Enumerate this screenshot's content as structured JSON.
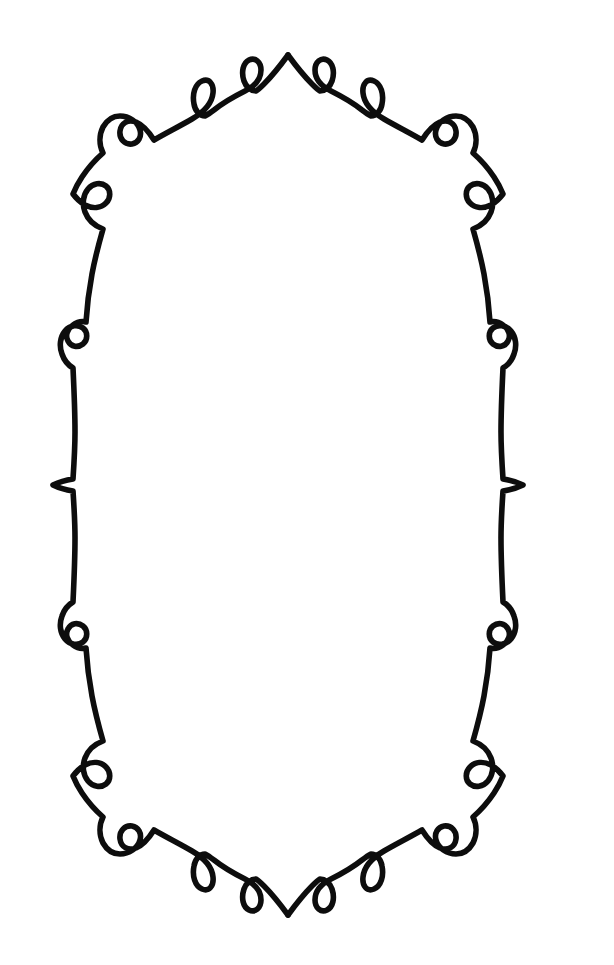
{
  "artwork": {
    "title": "Decorative Oval Scroll Frame",
    "kind": "line-ornament",
    "canvas_width": 614,
    "canvas_height": 965,
    "background_color": "#ffffff",
    "stroke_color": "#0d0d0d",
    "stroke_width": 5.6,
    "symmetry": "bilateral vertical mirror; near top-bottom mirror",
    "orientation": "portrait",
    "line_count": 1,
    "description": "A single continuous calligraphic line forming a tall oval border decorated with teardrop loops, round curls, and paired spiral hooks."
  },
  "geometry": {
    "oval_center_x": 295,
    "oval_center_y": 484,
    "oval_half_width": 280,
    "oval_half_height": 430,
    "top_cusp": {
      "x": 288,
      "y": 55
    },
    "bottom_cusp": {
      "x": 285,
      "y": 912
    },
    "left_cusp": {
      "x": 8,
      "y": 485
    },
    "right_cusp": {
      "x": 560,
      "y": 485
    }
  },
  "motifs": [
    {
      "name": "top-cusp",
      "type": "cusp",
      "x": 288,
      "y": 55,
      "direction": "up"
    },
    {
      "name": "top-left-teardrop",
      "type": "teardrop-loop",
      "x": 240,
      "y": 70,
      "size": 30
    },
    {
      "name": "top-right-teardrop",
      "type": "teardrop-loop",
      "x": 334,
      "y": 70,
      "size": 30
    },
    {
      "name": "upper-left-teardrop",
      "type": "teardrop-loop",
      "x": 193,
      "y": 128,
      "size": 34
    },
    {
      "name": "upper-right-teardrop",
      "type": "teardrop-loop",
      "x": 378,
      "y": 128,
      "size": 34
    },
    {
      "name": "upper-left-double-curl",
      "type": "spiral-pair",
      "x": 126,
      "y": 140,
      "size": 40
    },
    {
      "name": "upper-right-double-curl",
      "type": "spiral-pair",
      "x": 446,
      "y": 140,
      "size": 40
    },
    {
      "name": "left-upper-round-loop",
      "type": "round-loop",
      "x": 85,
      "y": 230,
      "size": 26
    },
    {
      "name": "right-upper-round-loop",
      "type": "round-loop",
      "x": 485,
      "y": 230,
      "size": 26
    },
    {
      "name": "left-small-loop",
      "type": "round-loop",
      "x": 35,
      "y": 305,
      "size": 18
    },
    {
      "name": "right-small-loop",
      "type": "round-loop",
      "x": 532,
      "y": 305,
      "size": 18
    },
    {
      "name": "left-mid-cusp",
      "type": "cusp",
      "x": 8,
      "y": 485,
      "direction": "left"
    },
    {
      "name": "right-mid-cusp",
      "type": "cusp",
      "x": 560,
      "y": 485,
      "direction": "right"
    },
    {
      "name": "left-lower-small-loop",
      "type": "round-loop",
      "x": 37,
      "y": 663,
      "size": 18
    },
    {
      "name": "right-lower-small-loop",
      "type": "round-loop",
      "x": 530,
      "y": 663,
      "size": 18
    },
    {
      "name": "left-lower-round-loop",
      "type": "round-loop",
      "x": 85,
      "y": 745,
      "size": 26
    },
    {
      "name": "right-lower-round-loop",
      "type": "round-loop",
      "x": 483,
      "y": 745,
      "size": 26
    },
    {
      "name": "lower-left-double-curl",
      "type": "spiral-pair",
      "x": 126,
      "y": 840,
      "size": 40
    },
    {
      "name": "lower-right-double-curl",
      "type": "spiral-pair",
      "x": 446,
      "y": 840,
      "size": 40
    },
    {
      "name": "bottom-left-teardrop",
      "type": "teardrop-loop",
      "x": 196,
      "y": 848,
      "size": 34
    },
    {
      "name": "bottom-right-teardrop",
      "type": "teardrop-loop",
      "x": 372,
      "y": 848,
      "size": 34
    },
    {
      "name": "bottom-left-inner-teardrop",
      "type": "teardrop-loop",
      "x": 243,
      "y": 898,
      "size": 30
    },
    {
      "name": "bottom-right-inner-teardrop",
      "type": "teardrop-loop",
      "x": 325,
      "y": 898,
      "size": 30
    },
    {
      "name": "bottom-cusp",
      "type": "cusp",
      "x": 285,
      "y": 912,
      "direction": "down"
    }
  ],
  "paths": {
    "right_half": "M 288,55 C 296,66 304,76 312,84 C 316,88 318,90 320,91 C 325,91 330,87 332,81 C 335,72 333,63 327,60 C 321,57 315,62 315,70 C 315,79 321,86 331,91 C 341,96 352,102 362,110 C 366,113 369,115 371,116 C 376,116 381,111 382,104 C 384,94 381,84 374,81 C 367,78 362,84 363,93 C 364,103 372,112 384,119 C 396,126 410,133 422,140 C 427,132 433,125 440,122 C 448,119 455,123 456,131 C 457,139 451,145 444,144 C 438,143 434,137 436,130 C 438,122 447,116 456,116 C 463,116 469,120 473,127 C 477,135 477,145 473,153 C 481,160 488,168 494,177 C 498,183 501,189 503,194 C 500,198 496,202 491,205 C 483,209 475,208 470,203 C 465,198 465,190 470,186 C 475,182 483,183 488,189 C 493,195 494,204 491,212 C 488,220 481,226 473,229 C 477,243 481,258 484,274 C 487,290 489,306 490,322 C 494,321 499,322 503,325 C 509,329 511,336 508,341 C 505,347 498,348 493,344 C 488,340 488,332 493,328 C 498,324 506,325 511,331 C 516,337 517,346 514,354 C 512,360 508,365 503,368 C 502,389 501,410 501,432 C 501,448 502,464 503,479 C 510,480 517,482 523,485 C 517,488 510,490 503,491 C 502,506 501,522 501,538 C 501,560 502,581 503,602 C 508,605 512,610 514,616 C 517,624 516,633 511,639 C 506,645 498,646 493,642 C 488,638 488,630 493,626 C 498,622 505,623 508,629 C 511,634 509,641 503,645 C 499,648 494,649 490,648 C 489,664 487,680 484,696 C 481,712 477,727 473,741 C 481,744 488,750 491,758 C 494,766 493,775 488,781 C 483,787 475,788 470,784 C 465,780 465,772 470,767 C 475,762 483,761 491,765 C 496,768 500,772 503,776 C 501,781 498,787 494,793 C 488,802 481,810 473,817 C 477,825 477,835 473,843 C 469,850 463,854 456,854 C 447,854 438,848 436,840 C 434,833 438,827 444,826 C 451,825 457,831 456,839 C 455,847 448,851 440,848 C 433,845 427,838 422,830 C 410,837 396,844 384,851 C 372,858 364,867 363,877 C 362,886 367,892 374,889 C 381,886 384,876 382,866 C 381,859 376,854 371,854 C 369,855 366,857 362,860 C 352,868 341,874 331,879 C 321,884 315,891 315,900 C 315,908 321,913 327,910 C 333,907 335,898 332,889 C 330,883 325,879 320,879 C 318,880 316,882 312,886 C 304,894 296,904 288,915",
    "left_half": "M 288,55 C 280,66 272,76 264,84 C 260,88 258,90 256,91 C 251,91 246,87 244,81 C 241,72 243,63 249,60 C 255,57 261,62 261,70 C 261,79 255,86 245,91 C 235,96 224,102 214,110 C 210,113 207,115 205,116 C 200,116 195,111 194,104 C 192,94 195,84 202,81 C 209,78 214,84 213,93 C 212,103 204,112 192,119 C 180,126 166,133 154,140 C 149,132 143,125 136,122 C 128,119 121,123 120,131 C 119,139 125,145 132,144 C 138,143 142,137 140,130 C 138,122 129,116 120,116 C 113,116 107,120 103,127 C 99,135 99,145 103,153 C 95,160 88,168 82,177 C 78,183 75,189 73,194 C 76,198 80,202 85,205 C 93,209 101,208 106,203 C 111,198 111,190 106,186 C 101,182 93,183 88,189 C 83,195 82,204 85,212 C 88,220 95,226 103,229 C 99,243 95,258 92,274 C 89,290 87,306 86,322 C 82,321 77,322 73,325 C 67,329 65,336 68,341 C 71,347 78,348 83,344 C 88,340 88,332 83,328 C 78,324 70,325 65,331 C 60,337 59,346 62,354 C 64,360 68,365 73,368 C 74,389 75,410 75,432 C 75,448 74,464 73,479 C 66,480 59,482 53,485 C 59,488 66,490 73,491 C 74,506 75,522 75,538 C 75,560 74,581 73,602 C 68,605 64,610 62,616 C 59,624 60,633 65,639 C 70,645 78,646 83,642 C 88,638 88,630 83,626 C 78,622 71,623 68,629 C 65,634 67,641 73,645 C 77,648 82,649 86,648 C 87,664 89,680 92,696 C 95,712 99,727 103,741 C 95,744 88,750 85,758 C 82,766 83,775 88,781 C 93,787 101,788 106,784 C 111,780 111,772 106,767 C 101,762 93,761 85,765 C 80,768 76,772 73,776 C 75,781 78,787 82,793 C 88,802 95,810 103,817 C 99,825 99,835 103,843 C 107,850 113,854 120,854 C 129,854 138,848 140,840 C 142,833 138,827 132,826 C 125,825 119,831 120,839 C 121,847 128,851 136,848 C 143,845 149,838 154,830 C 166,837 180,844 192,851 C 204,858 212,867 213,877 C 214,886 209,892 202,889 C 195,886 192,876 194,866 C 195,859 200,854 205,854 C 207,855 210,857 214,860 C 224,868 235,874 245,879 C 255,884 261,891 261,900 C 261,908 255,913 249,910 C 243,907 241,898 244,889 C 246,883 251,879 256,879 C 258,880 260,882 264,886 C 272,894 280,904 288,915"
  }
}
